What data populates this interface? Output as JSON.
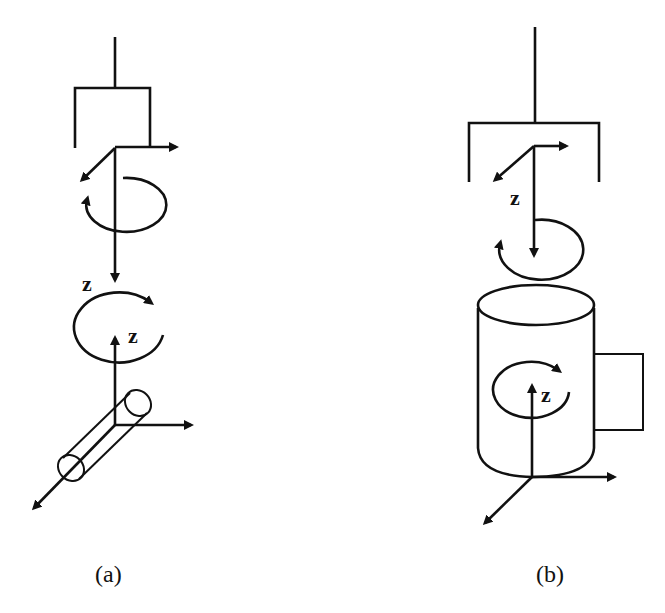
{
  "figure": {
    "panels": [
      {
        "id": "a",
        "caption": "(a)",
        "upper_axis_label": "z",
        "lower_axis_label": "z",
        "description": "Gripper with frame, z-axis pointing down with rotation; object frame with z-axis up and rotation; peg/tube object along diagonal axis"
      },
      {
        "id": "b",
        "caption": "(b)",
        "upper_axis_label": "z",
        "lower_axis_label": "z",
        "description": "Gripper with frame, z-axis pointing down with rotation; cylindrical mug-like object with handle, z-axis up with rotation"
      }
    ],
    "colors": {
      "stroke": "#111111",
      "background": "#ffffff"
    }
  }
}
